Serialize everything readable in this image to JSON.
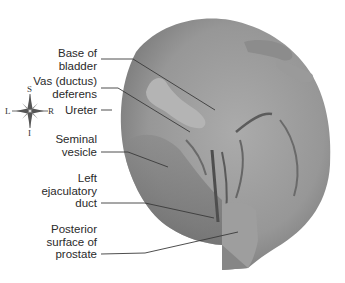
{
  "figure": {
    "colors": {
      "background": "#ffffff",
      "specimen_light": "#a8a8a8",
      "specimen_mid": "#8e8e8e",
      "specimen_dark": "#5c5c5c",
      "label_text": "#2a2a2a",
      "leader_line": "#3a3a3a"
    }
  },
  "compass": {
    "icon": "compass-rose-icon",
    "top": "S",
    "bottom": "I",
    "left": "L",
    "right": "R"
  },
  "labels": [
    {
      "lines": [
        "Base of",
        "bladder"
      ]
    },
    {
      "lines": [
        "Vas (ductus)",
        "deferens"
      ]
    },
    {
      "lines": [
        "Ureter"
      ]
    },
    {
      "lines": [
        "Seminal",
        "vesicle"
      ]
    },
    {
      "lines": [
        "Left",
        "ejaculatory",
        "duct"
      ]
    },
    {
      "lines": [
        "Posterior",
        "surface of",
        "prostate"
      ]
    }
  ]
}
